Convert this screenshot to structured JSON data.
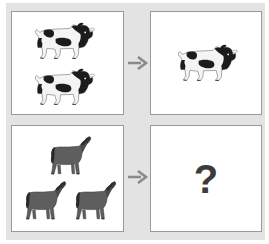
{
  "puzzle": {
    "type": "visual-analogy",
    "background_color": "#e3e3e3",
    "panel_background": "#ffffff",
    "panel_border_color": "#9a9a9a",
    "arrow_color": "#8a8a8a",
    "question_mark_color": "#3b3b3b",
    "rows": [
      {
        "id": "row-cows",
        "left_panel": {
          "name": "two-cows-panel",
          "animal": "cow",
          "count": 2,
          "arrangement": "stacked-vertical",
          "animal_colors": [
            "#1c1c1c",
            "#f2f2f2"
          ]
        },
        "arrow": {
          "name": "arrow-right",
          "glyph": "→"
        },
        "right_panel": {
          "name": "one-cow-panel",
          "animal": "cow",
          "count": 1,
          "arrangement": "centered",
          "animal_colors": [
            "#1c1c1c",
            "#f2f2f2"
          ]
        }
      },
      {
        "id": "row-horses",
        "left_panel": {
          "name": "three-horses-panel",
          "animal": "horse",
          "count": 3,
          "arrangement": "triangle-one-top-two-bottom",
          "animal_colors": [
            "#5b5b5b",
            "#2e2e2e"
          ]
        },
        "arrow": {
          "name": "arrow-right",
          "glyph": "→"
        },
        "right_panel": {
          "name": "answer-panel",
          "content": "?",
          "label": "?"
        }
      }
    ]
  }
}
